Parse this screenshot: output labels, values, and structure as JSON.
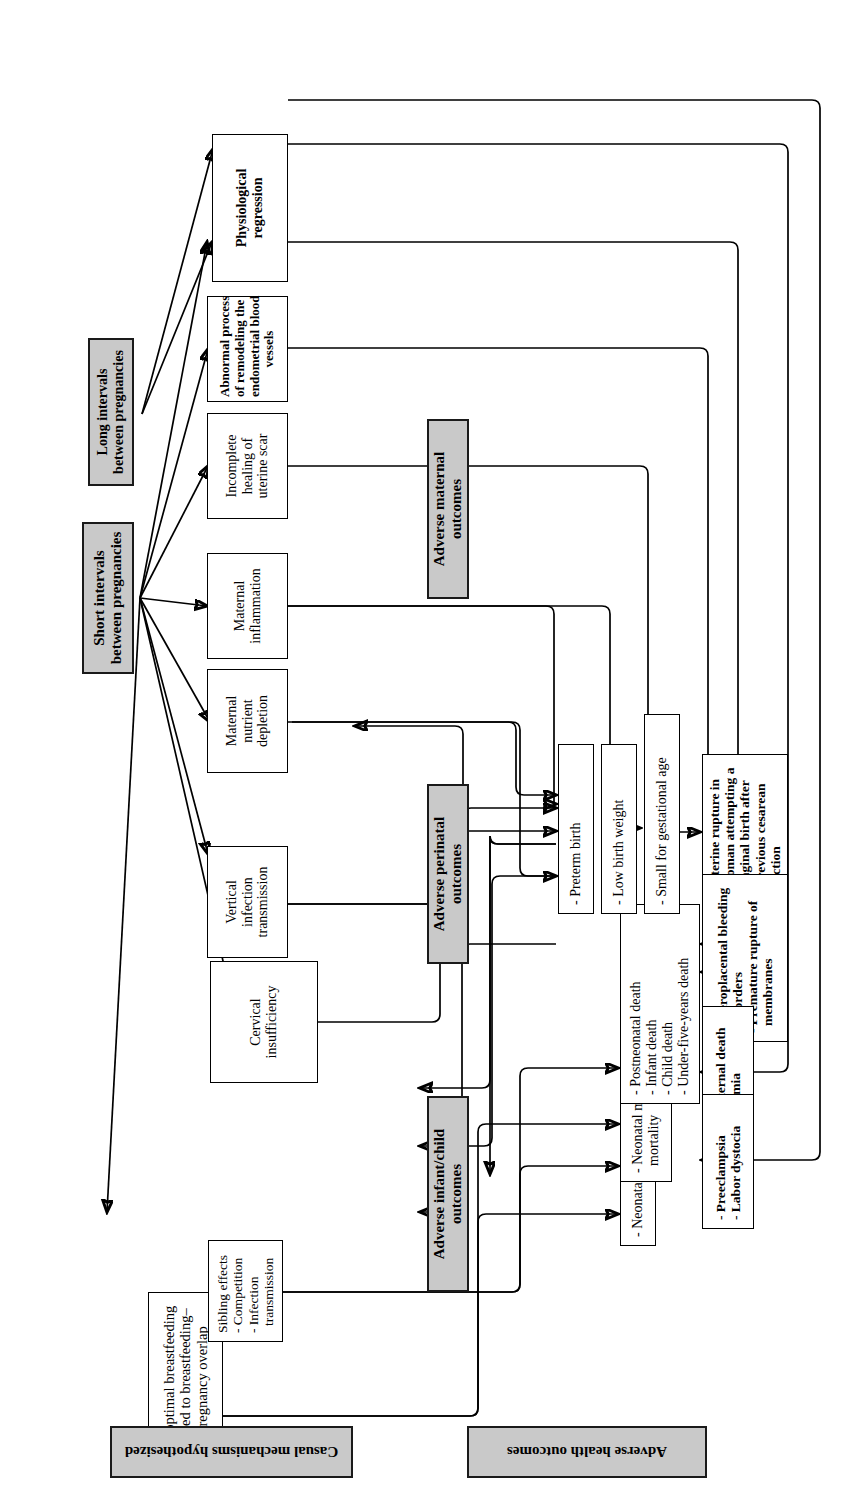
{
  "figure": {
    "orientation_note": "page rotated 90 degrees",
    "colors": {
      "header_fill": "#c9c9c9",
      "box_fill": "#ffffff",
      "stroke": "#000000"
    }
  },
  "exposures": [
    {
      "id": "short-intervals",
      "label": "Short intervals between pregnancies"
    },
    {
      "id": "long-intervals",
      "label": "Long intervals between pregnancies"
    }
  ],
  "section_labels": {
    "mechanisms": "Casual mechanisms hypothesized",
    "outcomes": "Adverse health outcomes"
  },
  "mechanisms": [
    {
      "id": "suboptimal-breastfeeding",
      "lines": [
        "Suboptimal breastfeeding",
        "related to breastfeeding–",
        "pregnancy overlap"
      ]
    },
    {
      "id": "sibling-effects",
      "heading": "Sibling effects",
      "items": [
        "- Competition",
        "- Infection",
        "transmission"
      ]
    },
    {
      "id": "cervical-insufficiency",
      "lines": [
        "Cervical",
        "insufficiency"
      ]
    },
    {
      "id": "vertical-infection-transmission",
      "lines": [
        "Vertical",
        "infection",
        "transmission"
      ]
    },
    {
      "id": "maternal-nutrient-depletion",
      "lines": [
        "Maternal",
        "nutrient",
        "depletion"
      ]
    },
    {
      "id": "maternal-inflammation",
      "lines": [
        "Maternal",
        "inflammation"
      ]
    },
    {
      "id": "incomplete-healing-uterine-scar",
      "lines": [
        "Incomplete",
        "healing of",
        "uterine scar"
      ]
    },
    {
      "id": "abnormal-remodeling",
      "lines": [
        "Abnormal process",
        "of remodeling the",
        "endometrial blood",
        "vessels"
      ]
    },
    {
      "id": "physiological-regression",
      "lines": [
        "Physiological",
        "regression"
      ]
    }
  ],
  "outcome_groups": [
    {
      "id": "infant-child",
      "header": "Adverse infant/child outcomes",
      "boxes": [
        {
          "id": "neonatal-growth",
          "items": [
            "- Neonatal growth"
          ]
        },
        {
          "id": "neonatal-morbidity-mortality",
          "items": [
            "- Neonatal morbidity and",
            "mortality"
          ]
        },
        {
          "id": "child-deaths",
          "items": [
            "- Postneonatal death",
            "- Infant death",
            "- Child death",
            "- Under-five-years death"
          ]
        }
      ]
    },
    {
      "id": "perinatal",
      "header": "Adverse perinatal outcomes",
      "boxes": [
        {
          "id": "preterm-birth",
          "items": [
            "- Preterm birth"
          ]
        },
        {
          "id": "low-birth-weight",
          "items": [
            "- Low birth weight"
          ]
        },
        {
          "id": "small-for-gestational-age",
          "items": [
            "- Small for gestational age"
          ]
        }
      ]
    },
    {
      "id": "maternal",
      "header": "Adverse maternal outcomes",
      "boxes": [
        {
          "id": "uterine-rupture",
          "items": [
            "- Uterine rupture in",
            "woman attempting a",
            "vaginal birth after",
            "previous cesarean",
            "section"
          ]
        },
        {
          "id": "bleeding-membranes",
          "items": [
            "- Uteroplacental bleeding",
            "disorders",
            "- Premature rupture of",
            "membranes"
          ]
        },
        {
          "id": "maternal-death-anemia",
          "items": [
            "- Maternal death",
            "- Anemia"
          ]
        },
        {
          "id": "preeclampsia-dystocia",
          "items": [
            "- Preeclampsia",
            "- Labor dystocia"
          ]
        }
      ]
    }
  ]
}
